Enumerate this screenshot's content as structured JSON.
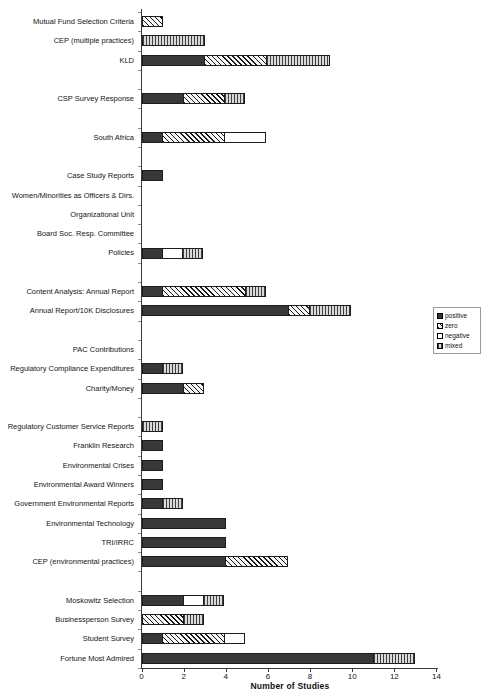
{
  "chart_data": {
    "type": "bar",
    "orientation": "horizontal",
    "stacked": true,
    "title": "",
    "xlabel": "Number of Studies",
    "ylabel": "",
    "xlim": [
      0,
      14
    ],
    "x_ticks": [
      0,
      2,
      4,
      6,
      8,
      10,
      12,
      14
    ],
    "grid": false,
    "legend": {
      "position": "right",
      "items": [
        {
          "key": "positive",
          "label": "positive"
        },
        {
          "key": "zero",
          "label": "zero"
        },
        {
          "key": "negative",
          "label": "negative"
        },
        {
          "key": "mixed",
          "label": "mixed"
        }
      ]
    },
    "pattern_colors": {
      "positive_fill": "#383838",
      "zero_line": "#161616",
      "zero_bg": "#f6f6f6",
      "negative_fill": "#ffffff",
      "mixed_line": "#404040",
      "mixed_bg": "#d9d9d9",
      "outline": "#1c1c1c"
    },
    "rows": [
      {
        "label": "Mutual Fund Selection Criteria",
        "segments": [
          {
            "type": "zero",
            "value": 1
          }
        ]
      },
      {
        "label": "CEP (multiple practices)",
        "segments": [
          {
            "type": "mixed",
            "value": 3
          }
        ]
      },
      {
        "label": "KLD",
        "segments": [
          {
            "type": "positive",
            "value": 3
          },
          {
            "type": "zero",
            "value": 3
          },
          {
            "type": "mixed",
            "value": 3
          }
        ]
      },
      {
        "spacer": true
      },
      {
        "label": "CSP Survey Response",
        "segments": [
          {
            "type": "positive",
            "value": 2
          },
          {
            "type": "zero",
            "value": 2
          },
          {
            "type": "mixed",
            "value": 1
          }
        ]
      },
      {
        "spacer": true
      },
      {
        "label": "South Africa",
        "segments": [
          {
            "type": "positive",
            "value": 1
          },
          {
            "type": "zero",
            "value": 3
          },
          {
            "type": "negative",
            "value": 2
          }
        ]
      },
      {
        "spacer": true
      },
      {
        "label": "Case Study Reports",
        "segments": [
          {
            "type": "positive",
            "value": 1
          }
        ]
      },
      {
        "label": "Women/Minorities as Officers & Dirs.",
        "segments": []
      },
      {
        "label": "Organizational Unit",
        "segments": []
      },
      {
        "label": "Board Soc. Resp. Committee",
        "segments": []
      },
      {
        "label": "Policies",
        "segments": [
          {
            "type": "positive",
            "value": 1
          },
          {
            "type": "negative",
            "value": 1
          },
          {
            "type": "mixed",
            "value": 1
          }
        ]
      },
      {
        "spacer": true
      },
      {
        "label": "Content Analysis: Annual Report",
        "segments": [
          {
            "type": "positive",
            "value": 1
          },
          {
            "type": "zero",
            "value": 4
          },
          {
            "type": "mixed",
            "value": 1
          }
        ]
      },
      {
        "label": "Annual Report/10K Disclosures",
        "segments": [
          {
            "type": "positive",
            "value": 7
          },
          {
            "type": "zero",
            "value": 1
          },
          {
            "type": "mixed",
            "value": 2
          }
        ]
      },
      {
        "spacer": true
      },
      {
        "label": "PAC Contributions",
        "segments": []
      },
      {
        "label": "Regulatory Compliance Expenditures",
        "segments": [
          {
            "type": "positive",
            "value": 1
          },
          {
            "type": "mixed",
            "value": 1
          }
        ]
      },
      {
        "label": "Charity/Money",
        "segments": [
          {
            "type": "positive",
            "value": 2
          },
          {
            "type": "zero",
            "value": 1
          }
        ]
      },
      {
        "spacer": true
      },
      {
        "label": "Regulatory Customer Service Reports",
        "segments": [
          {
            "type": "mixed",
            "value": 1
          }
        ]
      },
      {
        "label": "Franklin Research",
        "segments": [
          {
            "type": "positive",
            "value": 1
          }
        ]
      },
      {
        "label": "Environmental Crises",
        "segments": [
          {
            "type": "positive",
            "value": 1
          }
        ]
      },
      {
        "label": "Environmental Award Winners",
        "segments": [
          {
            "type": "positive",
            "value": 1
          }
        ]
      },
      {
        "label": "Government Environmental Reports",
        "segments": [
          {
            "type": "positive",
            "value": 1
          },
          {
            "type": "mixed",
            "value": 1
          }
        ]
      },
      {
        "label": "Environmental Technology",
        "segments": [
          {
            "type": "positive",
            "value": 4
          }
        ]
      },
      {
        "label": "TRI/IRRC",
        "segments": [
          {
            "type": "positive",
            "value": 4
          }
        ]
      },
      {
        "label": "CEP (environmental practices)",
        "segments": [
          {
            "type": "positive",
            "value": 4
          },
          {
            "type": "zero",
            "value": 3
          }
        ]
      },
      {
        "spacer": true
      },
      {
        "label": "Moskowitz Selection",
        "segments": [
          {
            "type": "positive",
            "value": 2
          },
          {
            "type": "negative",
            "value": 1
          },
          {
            "type": "mixed",
            "value": 1
          }
        ]
      },
      {
        "label": "Businessperson Survey",
        "segments": [
          {
            "type": "zero",
            "value": 2
          },
          {
            "type": "mixed",
            "value": 1
          }
        ]
      },
      {
        "label": "Student Survey",
        "segments": [
          {
            "type": "positive",
            "value": 1
          },
          {
            "type": "zero",
            "value": 3
          },
          {
            "type": "negative",
            "value": 1
          }
        ]
      },
      {
        "label": "Fortune Most Admired",
        "segments": [
          {
            "type": "positive",
            "value": 11
          },
          {
            "type": "mixed",
            "value": 2
          }
        ]
      }
    ]
  }
}
